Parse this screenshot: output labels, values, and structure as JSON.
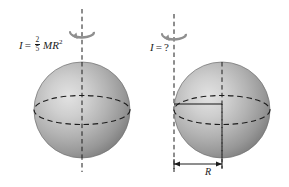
{
  "figure": {
    "background_color": "#ffffff",
    "ink_color": "#1c1c1c",
    "sphere_color_light": "#d8d8d8",
    "sphere_color_mid": "#a9a9a9",
    "sphere_color_dark": "#7e7e7e"
  },
  "left_panel": {
    "label_name": "moment-of-inertia-central-axis",
    "symbol": "I",
    "equals": "=",
    "numerator": "2",
    "denominator": "5",
    "mass_radius": "MR",
    "exponent": "2",
    "axis_type": "central",
    "rotation_arrow": "rotation-arrow-icon"
  },
  "right_panel": {
    "label_name": "moment-of-inertia-tangent-axis",
    "symbol": "I",
    "equals": "=",
    "value": "?",
    "axis_type": "tangent",
    "rotation_arrow": "rotation-arrow-icon",
    "dimension_label": "R"
  }
}
